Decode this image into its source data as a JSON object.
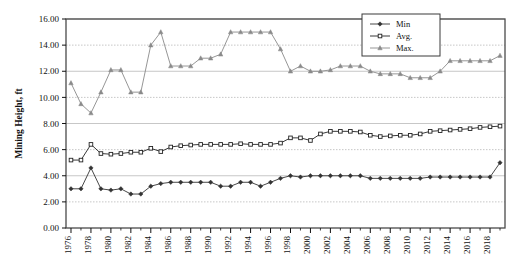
{
  "chart_data": {
    "type": "line",
    "title": "",
    "xlabel": "",
    "ylabel": "Mining Height, ft",
    "xlim": [
      1975.5,
      2019.5
    ],
    "ylim": [
      0.0,
      16.0
    ],
    "ytick_step": 2.0,
    "xtick_step": 2,
    "grid": true,
    "grid_axis": "y",
    "legend_position": "top-right",
    "x": [
      1976,
      1977,
      1978,
      1979,
      1980,
      1981,
      1982,
      1983,
      1984,
      1985,
      1986,
      1987,
      1988,
      1989,
      1990,
      1991,
      1992,
      1993,
      1994,
      1995,
      1996,
      1997,
      1998,
      1999,
      2000,
      2001,
      2002,
      2003,
      2004,
      2005,
      2006,
      2007,
      2008,
      2009,
      2010,
      2011,
      2012,
      2013,
      2014,
      2015,
      2016,
      2017,
      2018,
      2019
    ],
    "ytick_labels": [
      "0.00",
      "2.00",
      "4.00",
      "6.00",
      "8.00",
      "10.00",
      "12.00",
      "14.00",
      "16.00"
    ],
    "ytick_values": [
      0.0,
      2.0,
      4.0,
      6.0,
      8.0,
      10.0,
      12.0,
      14.0,
      16.0
    ],
    "xtick_labels": [
      "1976",
      "1978",
      "1980",
      "1982",
      "1984",
      "1986",
      "1988",
      "1990",
      "1992",
      "1994",
      "1996",
      "1998",
      "2000",
      "2002",
      "2004",
      "2006",
      "2008",
      "2010",
      "2012",
      "2014",
      "2016",
      "2018"
    ],
    "xtick_values": [
      1976,
      1978,
      1980,
      1982,
      1984,
      1986,
      1988,
      1990,
      1992,
      1994,
      1996,
      1998,
      2000,
      2002,
      2004,
      2006,
      2008,
      2010,
      2012,
      2014,
      2016,
      2018
    ],
    "series": [
      {
        "name": "Min",
        "marker": "filled-diamond",
        "color": "#333333",
        "values": [
          3.0,
          3.0,
          4.6,
          3.0,
          2.9,
          3.0,
          2.6,
          2.6,
          3.2,
          3.4,
          3.5,
          3.5,
          3.5,
          3.5,
          3.5,
          3.2,
          3.2,
          3.5,
          3.5,
          3.2,
          3.5,
          3.8,
          4.0,
          3.9,
          4.0,
          4.0,
          4.0,
          4.0,
          4.0,
          4.0,
          3.8,
          3.8,
          3.8,
          3.8,
          3.8,
          3.8,
          3.9,
          3.9,
          3.9,
          3.9,
          3.9,
          3.9,
          3.9,
          5.0
        ]
      },
      {
        "name": "Avg.",
        "marker": "open-square",
        "color": "#222222",
        "values": [
          5.2,
          5.2,
          6.4,
          5.7,
          5.65,
          5.7,
          5.8,
          5.8,
          6.1,
          5.85,
          6.2,
          6.3,
          6.35,
          6.4,
          6.4,
          6.4,
          6.4,
          6.45,
          6.4,
          6.4,
          6.4,
          6.5,
          6.9,
          6.9,
          6.7,
          7.2,
          7.4,
          7.4,
          7.4,
          7.35,
          7.1,
          7.0,
          7.05,
          7.1,
          7.1,
          7.2,
          7.4,
          7.45,
          7.5,
          7.55,
          7.6,
          7.7,
          7.75,
          7.8
        ]
      },
      {
        "name": "Max.",
        "marker": "triangle",
        "color": "#8a8a8a",
        "values": [
          11.1,
          9.5,
          8.8,
          10.4,
          12.1,
          12.1,
          10.4,
          10.4,
          14.0,
          15.0,
          12.4,
          12.4,
          12.4,
          13.0,
          13.0,
          13.3,
          15.0,
          15.0,
          15.0,
          15.0,
          15.0,
          13.7,
          12.0,
          12.4,
          12.0,
          12.0,
          12.1,
          12.4,
          12.4,
          12.4,
          12.0,
          11.8,
          11.8,
          11.8,
          11.5,
          11.5,
          11.5,
          12.0,
          12.8,
          12.8,
          12.8,
          12.8,
          12.8,
          13.2
        ]
      }
    ]
  },
  "legend": {
    "entries": [
      {
        "label": "Min"
      },
      {
        "label": "Avg."
      },
      {
        "label": "Max."
      }
    ]
  },
  "colors": {
    "min": "#333333",
    "avg": "#222222",
    "max": "#8a8a8a",
    "grid": "#b9b9b9",
    "axis": "#4a4a4a",
    "background": "#ffffff"
  }
}
